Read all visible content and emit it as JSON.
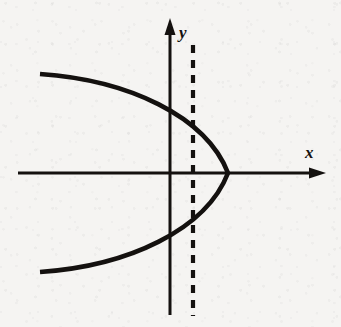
{
  "figure": {
    "name": "leftward-opening-parabola-with-vertical-test-line",
    "width": 341,
    "height": 327,
    "background_color": "#f5f4f2",
    "ink_color": "#14110f"
  },
  "axes": {
    "x_axis": {
      "label": "x",
      "label_x": 311,
      "label_y": 158,
      "y": 173,
      "start_x": 18,
      "end_x": 326,
      "stroke_width": 3.0,
      "arrow_length": 17,
      "arrow_half_height": 5.5
    },
    "y_axis": {
      "label": "y",
      "label_x": 179,
      "label_y": 38,
      "x": 170,
      "start_y": 315,
      "end_y": 18,
      "stroke_width": 3.0,
      "arrow_length": 17,
      "arrow_half_width": 5.5
    }
  },
  "curve": {
    "name": "parabola",
    "orientation": "opens-left",
    "vertex": {
      "x": 228,
      "y": 173
    },
    "upper_endpoint": {
      "x": 40,
      "y": 74
    },
    "lower_endpoint": {
      "x": 40,
      "y": 272
    },
    "y_axis_crossings": [
      {
        "x": 170,
        "y": 105
      },
      {
        "x": 170,
        "y": 240
      }
    ],
    "stroke_width": 4.6,
    "path": "M 40 74 C 128 80 206 116 228 173 C 206 230 128 266 40 272"
  },
  "vertical_test_line": {
    "name": "dashed-vertical-line",
    "x": 193,
    "top_y": 45,
    "bottom_y": 316,
    "stroke_width": 4.2,
    "dash_length": 8,
    "gap_length": 7,
    "dash_array": "8 7"
  }
}
